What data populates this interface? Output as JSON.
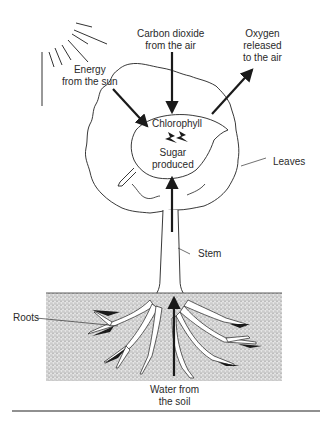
{
  "diagram": {
    "labels": {
      "energy": [
        "Energy",
        "from the sun"
      ],
      "co2": [
        "Carbon dioxide",
        "from the air"
      ],
      "oxygen": [
        "Oxygen",
        "released",
        "to the air"
      ],
      "chlorophyll": "Chlorophyll",
      "sugar": [
        "Sugar",
        "produced"
      ],
      "leaves": "Leaves",
      "stem": "Stem",
      "roots": "Roots",
      "water": [
        "Water from",
        "the soil"
      ]
    },
    "colors": {
      "ink": "#1a1a1a",
      "soil": "#9a9a9a",
      "background": "#ffffff"
    }
  }
}
